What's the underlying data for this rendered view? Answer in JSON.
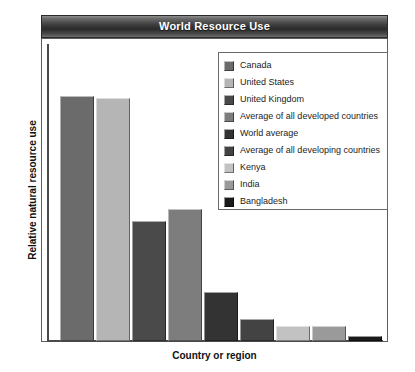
{
  "chart_data": {
    "type": "bar",
    "title": "World Resource Use",
    "xlabel": "Country or region",
    "ylabel": "Relative natural resource use",
    "grid": false,
    "legend_position": "top-right",
    "ylim": [
      0,
      100
    ],
    "categories": [
      "Canada",
      "United States",
      "United Kingdom",
      "Average of all developed countries",
      "World average",
      "Average of all developing countries",
      "Kenya",
      "India",
      "Bangladesh"
    ],
    "values": [
      100,
      99,
      49,
      54,
      20,
      9,
      6,
      6,
      2
    ],
    "colors": [
      "#6b6b6b",
      "#b5b5b5",
      "#4a4a4a",
      "#7d7d7d",
      "#333333",
      "#434343",
      "#c2c2c2",
      "#9a9a9a",
      "#1a1a1a"
    ],
    "series": [
      {
        "name": "Relative natural resource use",
        "values": [
          100,
          99,
          49,
          54,
          20,
          9,
          6,
          6,
          2
        ]
      }
    ]
  },
  "title_banner": {
    "text": "World Resource Use"
  },
  "legend": {
    "items": [
      {
        "label": "Canada",
        "color": "#6b6b6b"
      },
      {
        "label": "United States",
        "color": "#b5b5b5"
      },
      {
        "label": "United Kingdom",
        "color": "#4a4a4a"
      },
      {
        "label": "Average of all developed countries",
        "color": "#7d7d7d"
      },
      {
        "label": "World average",
        "color": "#333333"
      },
      {
        "label": "Average of all developing countries",
        "color": "#434343"
      },
      {
        "label": "Kenya",
        "color": "#c2c2c2"
      },
      {
        "label": "India",
        "color": "#9a9a9a"
      },
      {
        "label": "Bangladesh",
        "color": "#1a1a1a"
      }
    ]
  },
  "axes": {
    "y_title": "Relative natural resource use",
    "x_title": "Country or region"
  }
}
